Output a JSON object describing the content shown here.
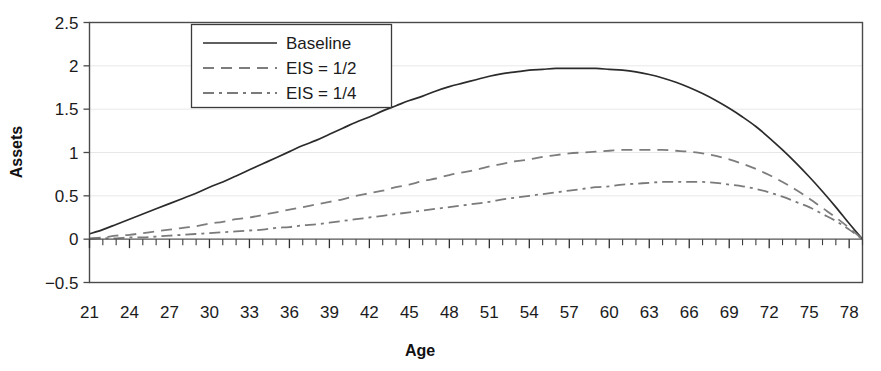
{
  "figure": {
    "width": 881,
    "height": 371,
    "background": "#ffffff"
  },
  "chart_data": {
    "type": "line",
    "title": "",
    "subtitle": "",
    "xlabel": "Age",
    "ylabel": "Assets",
    "xlim": [
      21,
      79
    ],
    "ylim": [
      -0.5,
      2.5
    ],
    "grid": true,
    "gridlines": "horizontal",
    "legend_position": "top-center",
    "x_tick_labels": [
      "21",
      "24",
      "27",
      "30",
      "33",
      "36",
      "39",
      "42",
      "45",
      "48",
      "51",
      "54",
      "57",
      "60",
      "63",
      "66",
      "69",
      "72",
      "75",
      "78"
    ],
    "x_ticks": [
      21,
      24,
      27,
      30,
      33,
      36,
      39,
      42,
      45,
      48,
      51,
      54,
      57,
      60,
      63,
      66,
      69,
      72,
      75,
      78
    ],
    "x_minor_tick_step": 1,
    "y_tick_labels": [
      "2.5",
      "2",
      "1.5",
      "1",
      "0.5",
      "0",
      "-0.5"
    ],
    "y_ticks": [
      2.5,
      2,
      1.5,
      1,
      0.5,
      0,
      -0.5
    ],
    "x": [
      21,
      22,
      23,
      24,
      25,
      26,
      27,
      28,
      29,
      30,
      31,
      32,
      33,
      34,
      35,
      36,
      37,
      38,
      39,
      40,
      41,
      42,
      43,
      44,
      45,
      46,
      47,
      48,
      49,
      50,
      51,
      52,
      53,
      54,
      55,
      56,
      57,
      58,
      59,
      60,
      61,
      62,
      63,
      64,
      65,
      66,
      67,
      68,
      69,
      70,
      71,
      72,
      73,
      74,
      75,
      76,
      77,
      78,
      79
    ],
    "series": [
      {
        "name": "Baseline",
        "style": "solid",
        "color": "#2b2b2b",
        "width": 1.7,
        "peak_x": 59,
        "peak_y": 1.97,
        "values": [
          0.06,
          0.11,
          0.17,
          0.23,
          0.29,
          0.35,
          0.41,
          0.47,
          0.53,
          0.6,
          0.66,
          0.73,
          0.8,
          0.87,
          0.94,
          1.01,
          1.08,
          1.14,
          1.21,
          1.28,
          1.35,
          1.41,
          1.48,
          1.54,
          1.6,
          1.65,
          1.71,
          1.76,
          1.8,
          1.84,
          1.88,
          1.91,
          1.93,
          1.95,
          1.96,
          1.97,
          1.97,
          1.97,
          1.97,
          1.96,
          1.95,
          1.93,
          1.9,
          1.86,
          1.81,
          1.75,
          1.68,
          1.6,
          1.51,
          1.41,
          1.3,
          1.17,
          1.03,
          0.88,
          0.72,
          0.55,
          0.37,
          0.18,
          0.0
        ]
      },
      {
        "name": "EIS = 1/2",
        "style": "dashed",
        "color": "#7d7d7d",
        "width": 1.8,
        "peak_x": 64,
        "peak_y": 1.03,
        "values": [
          0.01,
          0.02,
          0.04,
          0.05,
          0.07,
          0.09,
          0.11,
          0.13,
          0.15,
          0.18,
          0.2,
          0.23,
          0.25,
          0.28,
          0.31,
          0.34,
          0.37,
          0.4,
          0.43,
          0.46,
          0.5,
          0.53,
          0.56,
          0.6,
          0.63,
          0.67,
          0.7,
          0.74,
          0.77,
          0.8,
          0.84,
          0.87,
          0.9,
          0.92,
          0.95,
          0.97,
          0.99,
          1.0,
          1.01,
          1.02,
          1.03,
          1.03,
          1.03,
          1.03,
          1.02,
          1.01,
          0.99,
          0.96,
          0.92,
          0.87,
          0.81,
          0.74,
          0.66,
          0.57,
          0.47,
          0.36,
          0.25,
          0.13,
          0.0
        ]
      },
      {
        "name": "EIS = 1/4",
        "style": "dashdot",
        "color": "#7a7a7a",
        "width": 1.8,
        "peak_x": 66,
        "peak_y": 0.66,
        "values": [
          0.0,
          0.01,
          0.01,
          0.02,
          0.02,
          0.03,
          0.04,
          0.05,
          0.06,
          0.07,
          0.08,
          0.09,
          0.1,
          0.11,
          0.13,
          0.14,
          0.16,
          0.17,
          0.19,
          0.21,
          0.23,
          0.25,
          0.27,
          0.29,
          0.31,
          0.33,
          0.35,
          0.37,
          0.39,
          0.41,
          0.43,
          0.46,
          0.48,
          0.5,
          0.52,
          0.54,
          0.56,
          0.58,
          0.6,
          0.61,
          0.63,
          0.64,
          0.65,
          0.66,
          0.66,
          0.66,
          0.66,
          0.65,
          0.63,
          0.61,
          0.58,
          0.54,
          0.49,
          0.43,
          0.37,
          0.29,
          0.21,
          0.11,
          0.0
        ]
      }
    ]
  },
  "legend": {
    "items": [
      {
        "label": "Baseline"
      },
      {
        "label": "EIS = 1/2"
      },
      {
        "label": "EIS = 1/4"
      }
    ]
  },
  "axes": {
    "x_title": "Age",
    "y_title": "Assets"
  }
}
